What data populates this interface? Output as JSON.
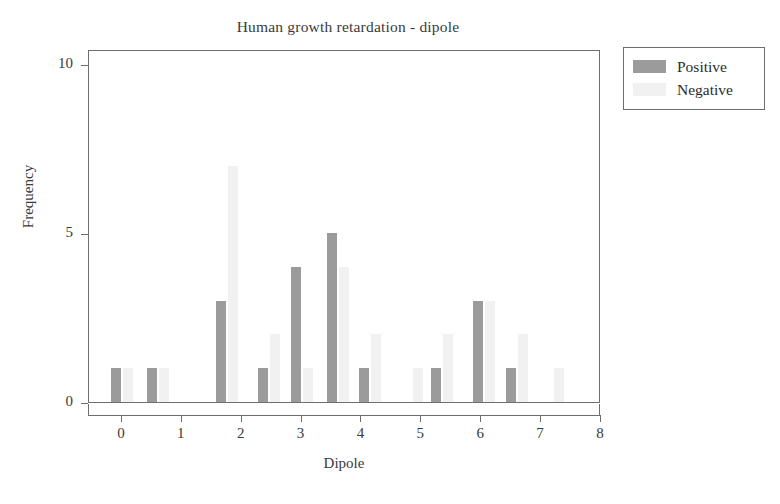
{
  "chart_data": {
    "type": "bar",
    "title": "Human growth retardation - dipole",
    "xlabel": "Dipole",
    "ylabel": "Frequency",
    "xlim": [
      -0.55,
      8.0
    ],
    "ylim": [
      0,
      10.45
    ],
    "xticks": [
      0,
      1,
      2,
      3,
      4,
      5,
      6,
      7,
      8
    ],
    "yticks": [
      0,
      5,
      10
    ],
    "grid": false,
    "legend_position": "outside-top-right",
    "colors": {
      "positive": "#9b9b9b",
      "negative": "#f1f1f1",
      "axis": "#6e6e6e",
      "text": "#3a3a3a",
      "background": "#ffffff"
    },
    "series": [
      {
        "name": "Positive",
        "color": "#9b9b9b"
      },
      {
        "name": "Negative",
        "color": "#f1f1f1"
      }
    ],
    "bars": [
      {
        "x": 0.0,
        "positive": 1,
        "negative": 1
      },
      {
        "x": 0.6,
        "positive": 1,
        "negative": 1
      },
      {
        "x": 1.75,
        "positive": 3,
        "negative": 7
      },
      {
        "x": 2.45,
        "positive": 1,
        "negative": 2
      },
      {
        "x": 3.0,
        "positive": 4,
        "negative": 1
      },
      {
        "x": 3.6,
        "positive": 5,
        "negative": 4
      },
      {
        "x": 4.15,
        "positive": 1,
        "negative": 2
      },
      {
        "x": 4.85,
        "positive": 0,
        "negative": 1
      },
      {
        "x": 5.35,
        "positive": 1,
        "negative": 2
      },
      {
        "x": 6.05,
        "positive": 3,
        "negative": 3
      },
      {
        "x": 6.6,
        "positive": 1,
        "negative": 2
      },
      {
        "x": 7.2,
        "positive": 0,
        "negative": 1
      }
    ]
  },
  "axes": {
    "x_tick_labels": [
      "0",
      "1",
      "2",
      "3",
      "4",
      "5",
      "6",
      "7",
      "8"
    ],
    "y_tick_labels": [
      "0",
      "5",
      "10"
    ],
    "x_title": "Dipole",
    "y_title": "Frequency"
  },
  "legend": {
    "items": [
      {
        "label": "Positive",
        "color": "#9b9b9b"
      },
      {
        "label": "Negative",
        "color": "#f1f1f1"
      }
    ]
  },
  "title": "Human growth retardation - dipole"
}
